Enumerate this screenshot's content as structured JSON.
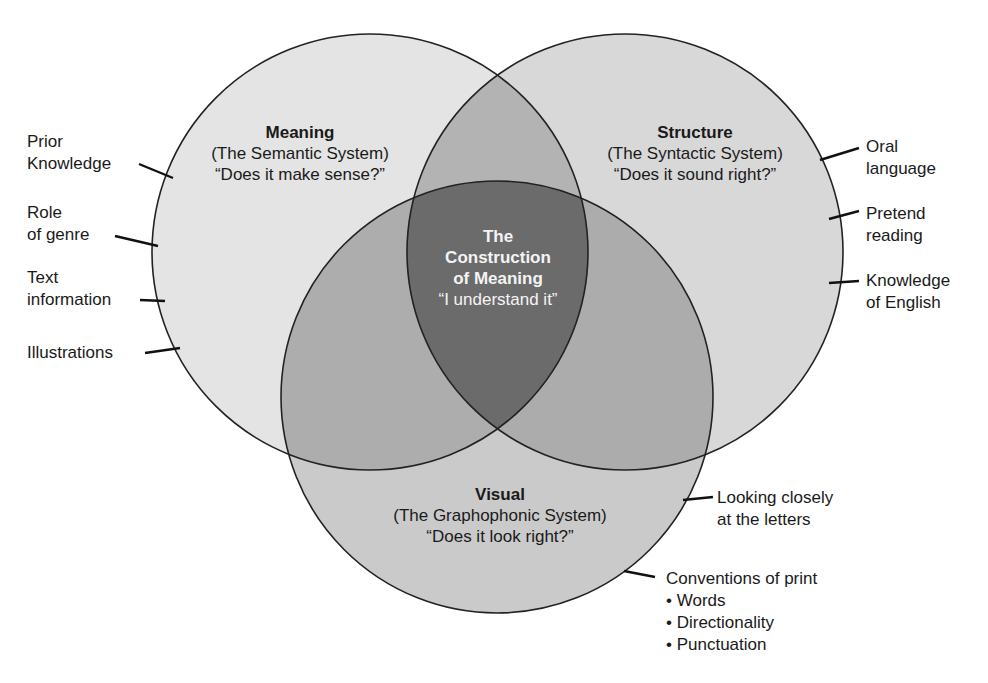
{
  "colors": {
    "meaning_only": "#e4e4e4",
    "structure_only": "#d8d8d8",
    "visual_only": "#cacaca",
    "meaning_structure": "#b3b3b3",
    "meaning_visual": "#adadad",
    "structure_visual": "#acacac",
    "center": "#6b6b6b",
    "stroke": "#222222"
  },
  "circles": {
    "meaning": {
      "title": "Meaning",
      "subtitle": "(The Semantic System)",
      "question": "“Does it make sense?”"
    },
    "structure": {
      "title": "Structure",
      "subtitle": "(The Syntactic System)",
      "question": "“Does it sound right?”"
    },
    "visual": {
      "title": "Visual",
      "subtitle": "(The Graphophonic System)",
      "question": "“Does it look right?”"
    }
  },
  "center": {
    "line1": "The",
    "line2": "Construction",
    "line3": "of Meaning",
    "quote": "“I understand it”"
  },
  "left_labels": [
    {
      "line1": "Prior",
      "line2": "Knowledge"
    },
    {
      "line1": "Role",
      "line2": "of genre"
    },
    {
      "line1": "Text",
      "line2": "information"
    },
    {
      "line1": "Illustrations"
    }
  ],
  "right_labels": [
    {
      "line1": "Oral",
      "line2": "language"
    },
    {
      "line1": "Pretend",
      "line2": "reading"
    },
    {
      "line1": "Knowledge",
      "line2": "of English"
    }
  ],
  "bottom_labels": {
    "looking": {
      "line1": "Looking closely",
      "line2": "at the letters"
    },
    "conventions": {
      "title": "Conventions of print",
      "items": [
        "Words",
        "Directionality",
        "Punctuation"
      ]
    }
  }
}
